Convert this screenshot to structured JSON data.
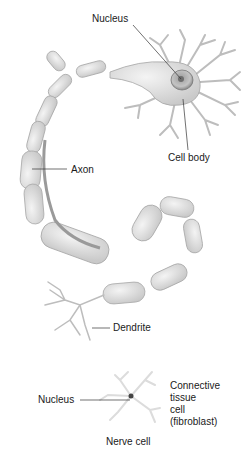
{
  "diagram": {
    "type": "anatomical-illustration",
    "labels": {
      "nucleus_top": "Nucleus",
      "cell_body": "Cell body",
      "axon": "Axon",
      "dendrite": "Dendrite",
      "nucleus_bottom": "Nucleus",
      "connective_tissue": [
        "Connective",
        "tissue",
        "cell",
        "(fibroblast)"
      ],
      "nerve_cell": "Nerve cell"
    },
    "colors": {
      "background": "#ffffff",
      "cell_fill": "#e4e4e4",
      "cell_stroke": "#9a9a9a",
      "nucleus": "#8a8a8a",
      "leader_line": "#333333",
      "fibroblast": "#dedede"
    }
  }
}
